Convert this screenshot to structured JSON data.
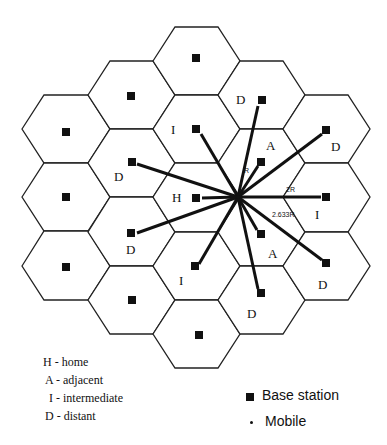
{
  "diagram": {
    "type": "hexagonal cellular layout",
    "cell_labels": [
      {
        "text": "D",
        "x": 240,
        "y": 104
      },
      {
        "text": "I",
        "x": 174,
        "y": 134
      },
      {
        "text": "A",
        "x": 270,
        "y": 150
      },
      {
        "text": "D",
        "x": 336,
        "y": 150
      },
      {
        "text": "D",
        "x": 119,
        "y": 181
      },
      {
        "text": "H",
        "x": 177,
        "y": 202
      },
      {
        "text": "I",
        "x": 318,
        "y": 218
      },
      {
        "text": "D",
        "x": 131,
        "y": 254
      },
      {
        "text": "A",
        "x": 273,
        "y": 257
      },
      {
        "text": "I",
        "x": 182,
        "y": 284
      },
      {
        "text": "D",
        "x": 323,
        "y": 288
      },
      {
        "text": "D",
        "x": 252,
        "y": 318
      }
    ],
    "distance_labels": [
      {
        "text": "R",
        "x": 245,
        "y": 173
      },
      {
        "text": "2R",
        "x": 286,
        "y": 192
      },
      {
        "text": "2.633R",
        "x": 270,
        "y": 217
      }
    ],
    "mobile": {
      "x": 238,
      "y": 197
    }
  },
  "legend": {
    "cell_types": [
      "H - home",
      "A - adjacent",
      "I - intermediate",
      "D - distant"
    ],
    "symbols": {
      "base_station": "Base station",
      "mobile": "Mobile"
    }
  },
  "colors": {
    "line": "#111111",
    "hex_stroke": "#222222",
    "background": "#ffffff"
  }
}
